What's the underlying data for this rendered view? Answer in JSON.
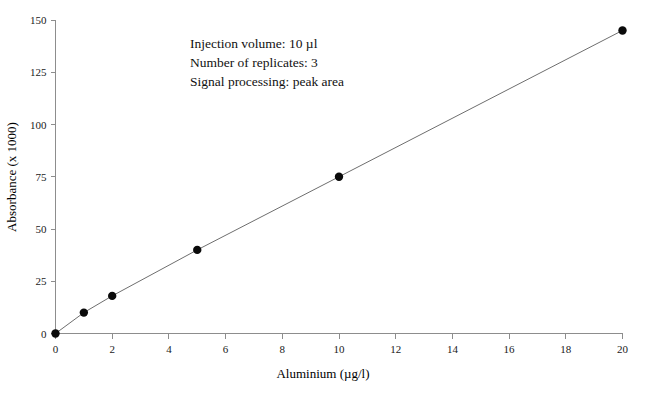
{
  "chart_data": {
    "type": "line",
    "title": "",
    "xlabel": "Aluminium  (µg/l)",
    "ylabel": "Absorbance  (x 1000)",
    "xlim": [
      0,
      20
    ],
    "ylim": [
      0,
      150
    ],
    "grid": false,
    "legend": null,
    "x": [
      0,
      1,
      2,
      5,
      10,
      20
    ],
    "values": [
      0,
      10,
      18,
      40,
      75,
      145
    ],
    "series": [
      {
        "name": "Aluminium calibration curve",
        "x": [
          0,
          1,
          2,
          5,
          10,
          20
        ],
        "values": [
          0,
          10,
          18,
          40,
          75,
          145
        ],
        "marker": "filled-circle",
        "line_color": "#6e6e6e",
        "marker_color": "#0a0a0a"
      }
    ],
    "xticks": [
      0,
      2,
      4,
      6,
      8,
      10,
      12,
      14,
      16,
      18,
      20
    ],
    "xtick_labels": [
      "0",
      "2",
      "4",
      "6",
      "8",
      "10",
      "12",
      "14",
      "16",
      "18",
      "20"
    ],
    "yticks": [
      0,
      25,
      50,
      75,
      100,
      125,
      150
    ],
    "ytick_labels": [
      "0",
      "25",
      "50",
      "75",
      "100",
      "125",
      "150"
    ],
    "annotations": [
      "Injection volume: 10 µl",
      "Number of replicates: 3",
      "Signal processing: peak area"
    ]
  },
  "colors": {
    "background": "#ffffff",
    "axis": "#8d8d8d",
    "line": "#6e6e6e",
    "marker": "#0a0a0a",
    "text": "#111111"
  }
}
